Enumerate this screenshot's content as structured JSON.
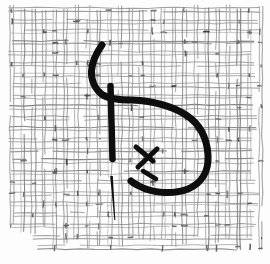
{
  "canvas": {
    "width": 270,
    "height": 264,
    "background": "#fdfdfd"
  },
  "colors": {
    "ink": "#0e0e0e",
    "paper": "#fdfdfd",
    "mesh_gray_min": 118,
    "mesh_gray_max": 175,
    "tick_gray_min": 58,
    "tick_gray_max": 115
  },
  "mesh": {
    "seed": 7,
    "origin_x": 12,
    "origin_y": 10,
    "pitch": 10.8,
    "columns": 24,
    "rows": 23,
    "thread_half_gap": 1.7,
    "tick_count": 155
  },
  "strokes": {
    "thread_curve": {
      "d": "M 102 45 C 97 52 92 62 91.5 71 C 91 80 95 89 102 94.5 C 109 99 120 100 132 100 C 152 101 172 106 186 115 C 200 124 207 139 208 155 C 209 171 202 183 188 189 C 172 195 152 193 139 186 C 135.5 184 133 183 131 181",
      "width": 7
    },
    "thread_tail": {
      "x1": 110.5,
      "y1": 86,
      "x2": 112.5,
      "y2": 159,
      "width": 6.5
    },
    "needle": {
      "top_x": 111.5,
      "top_y": 176,
      "tip_x": 114.8,
      "tip_y": 220,
      "top_width": 2.6,
      "tip_width": 1.0
    },
    "cross_stitch": [
      {
        "x1": 136,
        "y1": 147,
        "x2": 153,
        "y2": 161,
        "width": 5
      },
      {
        "x1": 157,
        "y1": 149,
        "x2": 138,
        "y2": 167,
        "width": 5
      },
      {
        "x1": 143,
        "y1": 171,
        "x2": 156,
        "y2": 179,
        "width": 4.5
      }
    ]
  }
}
